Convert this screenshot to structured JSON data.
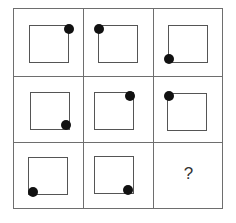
{
  "puzzle": {
    "rows": 3,
    "cols": 3,
    "cells": [
      {
        "row": 0,
        "col": 0,
        "shape": "square",
        "dot": "top-right"
      },
      {
        "row": 0,
        "col": 1,
        "shape": "square",
        "dot": "top-left"
      },
      {
        "row": 0,
        "col": 2,
        "shape": "square",
        "dot": "bottom-left"
      },
      {
        "row": 1,
        "col": 0,
        "shape": "square",
        "dot": "bottom-right"
      },
      {
        "row": 1,
        "col": 1,
        "shape": "square",
        "dot": "top-right"
      },
      {
        "row": 1,
        "col": 2,
        "shape": "square",
        "dot": "top-left"
      },
      {
        "row": 2,
        "col": 0,
        "shape": "square",
        "dot": "bottom-left"
      },
      {
        "row": 2,
        "col": 1,
        "shape": "square",
        "dot": "bottom-right"
      },
      {
        "row": 2,
        "col": 2,
        "shape": "unknown",
        "label": "?"
      }
    ],
    "missing_label": "?"
  }
}
